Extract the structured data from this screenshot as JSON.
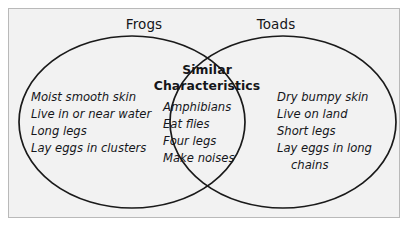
{
  "diagram": {
    "type": "venn",
    "frame": {
      "background_color": "#f2f2f2",
      "border_color": "#b9b9b9"
    },
    "stroke_color": "#1a1a1a",
    "left_circle": {
      "title": "Frogs",
      "items": [
        "Moist smooth skin",
        "Live in or near water",
        "Long legs",
        "Lay eggs in clusters"
      ]
    },
    "right_circle": {
      "title": "Toads",
      "items": [
        "Dry bumpy skin",
        "Live on land",
        "Short legs",
        "Lay eggs in long",
        "chains"
      ]
    },
    "intersection": {
      "heading_line1": "Similar",
      "heading_line2": "Characteristics",
      "items": [
        "Amphibians",
        "Eat flies",
        "Four legs",
        "Make noises"
      ]
    }
  }
}
